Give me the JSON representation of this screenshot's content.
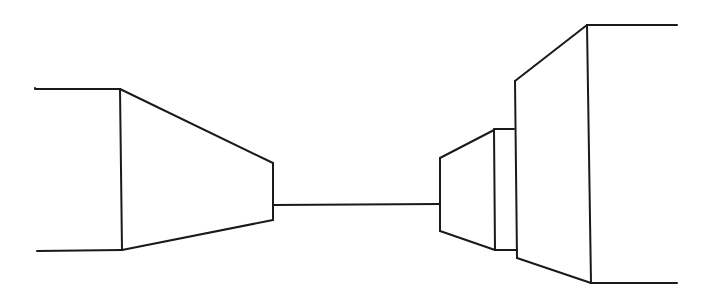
{
  "drawing": {
    "description": "One-point perspective line drawing of box shapes receding toward a central horizon line",
    "stroke_color": "#1a1a1a",
    "background": "#ffffff",
    "left_block": {
      "top_edge": [
        [
          35,
          89
        ],
        [
          120,
          89
        ]
      ],
      "bottom_edge": [
        [
          37,
          251
        ],
        [
          122,
          250
        ]
      ],
      "near_vertical": [
        [
          120,
          89
        ],
        [
          122,
          250
        ]
      ],
      "top_receding": [
        [
          120,
          89
        ],
        [
          273,
          163
        ]
      ],
      "bottom_receding": [
        [
          122,
          250
        ],
        [
          273,
          220
        ]
      ],
      "far_vertical": [
        [
          273,
          163
        ],
        [
          273,
          220
        ]
      ]
    },
    "horizon_line": [
      [
        273,
        205
      ],
      [
        440,
        205
      ]
    ],
    "right_small_block": {
      "far_vertical": [
        [
          440,
          158
        ],
        [
          440,
          231
        ]
      ],
      "top_receding": [
        [
          440,
          158
        ],
        [
          494,
          130
        ]
      ],
      "bottom_receding": [
        [
          440,
          231
        ],
        [
          495,
          250
        ]
      ],
      "near_vertical": [
        [
          494,
          130
        ],
        [
          495,
          250
        ]
      ]
    },
    "right_step": {
      "top_edge": [
        [
          494,
          129
        ],
        [
          514,
          129
        ]
      ],
      "bottom_edge": [
        [
          495,
          250
        ],
        [
          517,
          250
        ]
      ]
    },
    "right_large_block": {
      "far_vertical": [
        [
          515,
          81
        ],
        [
          517,
          258
        ]
      ],
      "top_receding": [
        [
          515,
          81
        ],
        [
          587,
          25
        ]
      ],
      "bottom_receding": [
        [
          517,
          258
        ],
        [
          591,
          283
        ]
      ],
      "near_vertical": [
        [
          587,
          25
        ],
        [
          591,
          283
        ]
      ],
      "top_edge": [
        [
          587,
          25
        ],
        [
          677,
          25
        ]
      ],
      "bottom_edge": [
        [
          591,
          283
        ],
        [
          677,
          283
        ]
      ]
    }
  }
}
